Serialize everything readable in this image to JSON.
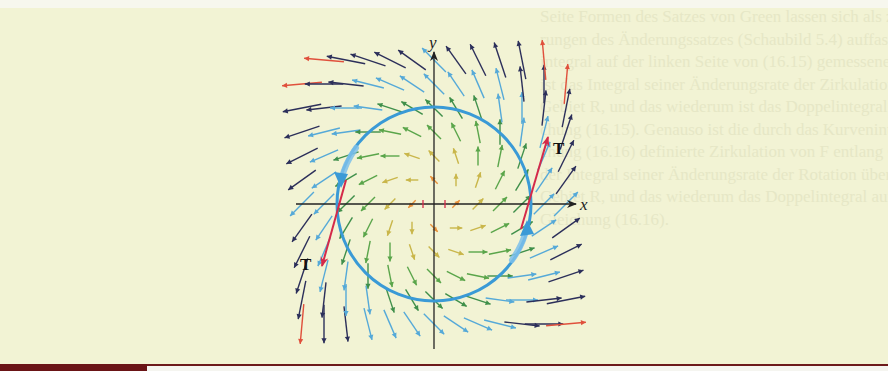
{
  "figure": {
    "axis_labels": {
      "x": "x",
      "y": "y"
    },
    "tangent_labels": [
      {
        "text": "T",
        "position": "upper-right"
      },
      {
        "text": "T",
        "position": "lower-left"
      }
    ],
    "colors": {
      "background": "#f2f3d4",
      "axis": "#222222",
      "curve": "#3a9ad6",
      "tangent": "#d42a4a",
      "magnitude_scale": [
        "#e8913a",
        "#c9b64a",
        "#5aa54a",
        "#3f8f4a",
        "#55a9d8",
        "#2c2f5a",
        "#e0503c"
      ],
      "bottom_bar": "#6a1416"
    },
    "curve": {
      "type": "circle",
      "orientation": "counterclockwise",
      "center_px": [
        434,
        204
      ],
      "radius_px": 97
    },
    "field": {
      "description": "Vector field F(x,y) = (x - y, x + y), arrows colored by magnitude",
      "grid_origin_px": [
        434,
        204
      ],
      "grid_step_px": [
        22,
        24
      ],
      "grid_x_range": [
        -6,
        6
      ],
      "grid_y_range": [
        -6,
        6
      ]
    }
  },
  "background_text_lines": [
    "Seite Formen des Satzes von Green lassen sich als zweidimensionale Verallgemeine-",
    "rungen des Änderungssatzes (Schaubild 5.4) auffassen. Der durch das Kurven-",
    "integral auf der linken Seite von (16.15) gemessene Zirkulation von F durch C",
    "ist das Integral seiner Änderungsrate der Zirkulation über das von C umschlossene",
    "Gebiet R, und das wiederum ist das Doppelintegral auf der rechten Seite von Glei-",
    "chung (16.15). Genauso ist die durch das Kurvenintegral auf der linken Seite von Glei-",
    "chung (16.16) definierte Zirkulation von F entlang C gleich dem Doppelintegral",
    "der Integral seiner Änderungsrate der Rotation über das von C umschlossene",
    "Gebiet R, und das wiederum das Doppelintegral auf der rechten Seite von",
    "Gleichung (16.16)."
  ]
}
